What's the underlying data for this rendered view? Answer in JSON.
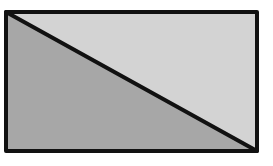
{
  "diagram": {
    "rectangle": {
      "x": 6,
      "y": 12,
      "width": 251,
      "height": 139
    },
    "diagonal": {
      "from": "top-left",
      "to": "bottom-right"
    },
    "colors": {
      "upper_right_triangle": "#d3d3d3",
      "lower_left_triangle": "#a7a7a7",
      "stroke": "#111111",
      "background": "#ffffff"
    },
    "stroke_width": 4
  }
}
